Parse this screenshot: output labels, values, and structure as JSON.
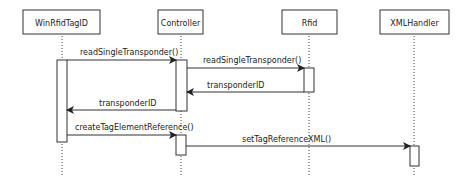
{
  "diagram": {
    "type": "sequence",
    "participants": [
      {
        "id": "winrfidtagid",
        "label": "WinRfidTagID"
      },
      {
        "id": "controller",
        "label": "Controller"
      },
      {
        "id": "rfid",
        "label": "Rfid"
      },
      {
        "id": "xmlhandler",
        "label": "XMLHandler"
      }
    ],
    "messages": [
      {
        "from": "WinRfidTagID",
        "to": "Controller",
        "label": "readSingleTransponder()",
        "kind": "call"
      },
      {
        "from": "Controller",
        "to": "Rfid",
        "label": "readSingleTransponder()",
        "kind": "call"
      },
      {
        "from": "Rfid",
        "to": "Controller",
        "label": "transponderID",
        "kind": "return"
      },
      {
        "from": "Controller",
        "to": "WinRfidTagID",
        "label": "transponderID",
        "kind": "return"
      },
      {
        "from": "WinRfidTagID",
        "to": "Controller",
        "label": "createTagElementReference()",
        "kind": "call"
      },
      {
        "from": "Controller",
        "to": "XMLHandler",
        "label": "setTagReferenceXML()",
        "kind": "call"
      }
    ],
    "colors": {
      "line": "#333333",
      "box_border": "#333333",
      "background": "#ffffff"
    }
  }
}
